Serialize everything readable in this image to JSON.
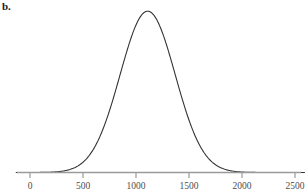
{
  "figure": {
    "panel_label": "b.",
    "background_color": "#ffffff"
  },
  "chart_data": {
    "type": "line",
    "title": "",
    "subtitle": "",
    "xlabel": "",
    "ylabel": "",
    "legend": [],
    "legend_position": "none",
    "grid": false,
    "curve_color": "#333333",
    "axis_color": "#9a9a9a",
    "tick_label_color": "#4d4d4d",
    "xlim": [
      -130,
      2590
    ],
    "ylim": [
      0,
      1.06
    ],
    "xticks": [
      0,
      500,
      1000,
      1500,
      2000,
      2500
    ],
    "xtick_labels": [
      "0",
      "500",
      "1000",
      "1500",
      "2000",
      "2500"
    ],
    "yticks": [],
    "ytick_labels": [],
    "distribution": {
      "kind": "normal",
      "mean": 1110,
      "std_dev": 260,
      "peak_x": 1110,
      "peak_y": 1.0
    },
    "x": [
      -130,
      0,
      100,
      200,
      300,
      350,
      400,
      450,
      500,
      550,
      600,
      650,
      700,
      750,
      800,
      850,
      900,
      950,
      1000,
      1050,
      1100,
      1110,
      1150,
      1200,
      1250,
      1300,
      1350,
      1400,
      1450,
      1500,
      1550,
      1600,
      1650,
      1700,
      1750,
      1800,
      1850,
      1900,
      1950,
      2000,
      2100,
      2200,
      2300,
      2400,
      2500,
      2590
    ],
    "y": [
      0.0,
      0.002,
      0.006,
      0.014,
      0.031,
      0.045,
      0.063,
      0.086,
      0.115,
      0.151,
      0.193,
      0.242,
      0.298,
      0.359,
      0.424,
      0.521,
      0.62,
      0.716,
      0.803,
      0.905,
      0.998,
      1.0,
      0.987,
      0.947,
      0.884,
      0.802,
      0.709,
      0.611,
      0.514,
      0.422,
      0.339,
      0.266,
      0.204,
      0.153,
      0.112,
      0.08,
      0.056,
      0.038,
      0.025,
      0.016,
      0.006,
      0.002,
      0.001,
      0.0005,
      0.0002,
      0.0
    ],
    "annotations": []
  }
}
